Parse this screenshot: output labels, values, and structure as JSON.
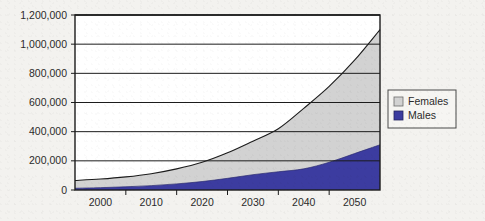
{
  "chart_data": {
    "type": "area",
    "stacked": true,
    "title": "",
    "subtitle": "",
    "xlabel": "",
    "ylabel": "",
    "grid": true,
    "grid_orientation": "horizontal",
    "legend_position": "right",
    "xlim": [
      1995,
      2055
    ],
    "ylim": [
      0,
      1200000
    ],
    "x": [
      1995,
      2000,
      2005,
      2010,
      2015,
      2020,
      2025,
      2030,
      2035,
      2040,
      2045,
      2050,
      2055
    ],
    "xticks": [
      2000,
      2010,
      2020,
      2030,
      2040,
      2050
    ],
    "xtick_labels": [
      "2000",
      "2010",
      "2020",
      "2030",
      "2040",
      "2050"
    ],
    "yticks": [
      0,
      200000,
      400000,
      600000,
      800000,
      1000000,
      1200000
    ],
    "ytick_labels": [
      "0",
      "200,000",
      "400,000",
      "600,000",
      "800,000",
      "1,000,000",
      "1,200,000"
    ],
    "series": [
      {
        "name": "Males",
        "color": "#3c3ca0",
        "values": [
          12000,
          16000,
          22000,
          30000,
          42000,
          58000,
          80000,
          105000,
          125000,
          145000,
          190000,
          250000,
          310000
        ]
      },
      {
        "name": "Females",
        "color": "#d2d2d2",
        "values": [
          53000,
          59000,
          68000,
          82000,
          103000,
          132000,
          175000,
          230000,
          295000,
          415000,
          520000,
          640000,
          790000
        ]
      }
    ],
    "totals": [
      65000,
      75000,
      90000,
      112000,
      145000,
      190000,
      255000,
      335000,
      420000,
      560000,
      710000,
      890000,
      1100000
    ]
  },
  "legend": {
    "items": [
      {
        "label": "Females",
        "color": "#d2d2d2"
      },
      {
        "label": "Males",
        "color": "#3c3ca0"
      }
    ]
  },
  "axes": {
    "y_tick_labels": [
      "1,200,000",
      "1,000,000",
      "800,000",
      "600,000",
      "400,000",
      "200,000",
      "0"
    ],
    "x_tick_labels": [
      "2000",
      "2010",
      "2020",
      "2030",
      "2040",
      "2050"
    ]
  },
  "colors": {
    "background": "#f3f2ef",
    "axis": "#1c1c1c",
    "grid": "#1c1c1c",
    "males": "#3c3ca0",
    "females": "#d2d2d2",
    "legend_border": "#4a4a4a"
  }
}
